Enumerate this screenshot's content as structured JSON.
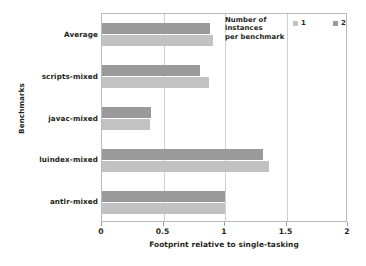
{
  "chart_data": {
    "type": "bar",
    "orientation": "horizontal",
    "title": "",
    "xlabel": "Footprint relative to single-tasking",
    "ylabel": "Benchmarks",
    "xlim": [
      0,
      2
    ],
    "xticks": [
      "0",
      "0.5",
      "1",
      "1.5",
      "2"
    ],
    "xtick_values": [
      0,
      0.5,
      1,
      1.5,
      2
    ],
    "grid": true,
    "grid_axis": "x",
    "legend": {
      "title_lines": [
        "Number of",
        "instances",
        "per benchmark"
      ],
      "title": "Number of instances per benchmark",
      "position": "top-right-inside",
      "entries": [
        {
          "label": "1",
          "color": "#c2c2c2"
        },
        {
          "label": "2",
          "color": "#9a9a9a"
        }
      ]
    },
    "categories": [
      "Average",
      "scripts-mixed",
      "javac-mixed",
      "luindex-mixed",
      "antlr-mixed"
    ],
    "series": [
      {
        "name": "1",
        "color": "#c2c2c2",
        "values": [
          0.9,
          0.87,
          0.39,
          1.36,
          1.0
        ]
      },
      {
        "name": "2",
        "color": "#9a9a9a",
        "values": [
          0.88,
          0.8,
          0.4,
          1.31,
          1.0
        ]
      }
    ]
  }
}
